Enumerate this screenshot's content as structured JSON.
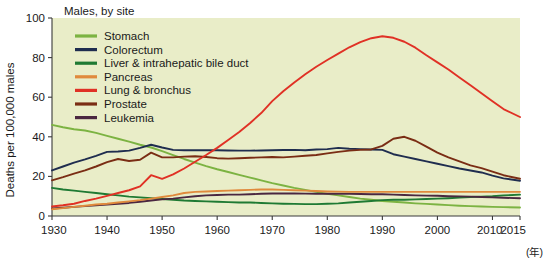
{
  "chart_data": {
    "type": "line",
    "title": "Males, by site",
    "xlabel": "",
    "ylabel": "Deaths per 100,000 males",
    "unit_note": "(年)",
    "xlim": [
      1930,
      2015
    ],
    "ylim": [
      0,
      100
    ],
    "xticks": [
      1930,
      1940,
      1950,
      1960,
      1970,
      1980,
      1990,
      2000,
      2010,
      2015
    ],
    "xtick_labels": [
      "1930",
      "1940",
      "1950",
      "1960",
      "1970",
      "1980",
      "1990",
      "2000",
      "2010",
      "2015"
    ],
    "yticks": [
      0,
      20,
      40,
      60,
      80,
      100
    ],
    "ytick_labels": [
      "0",
      "20",
      "40",
      "60",
      "80",
      "100"
    ],
    "grid": false,
    "legend_position": "upper-left-inside",
    "plot_background": "#e9edc8",
    "x": [
      1930,
      1932,
      1934,
      1936,
      1938,
      1940,
      1942,
      1944,
      1946,
      1948,
      1950,
      1952,
      1954,
      1956,
      1958,
      1960,
      1962,
      1964,
      1966,
      1968,
      1970,
      1972,
      1974,
      1976,
      1978,
      1980,
      1982,
      1984,
      1986,
      1988,
      1990,
      1992,
      1994,
      1996,
      1998,
      2000,
      2002,
      2004,
      2006,
      2008,
      2010,
      2012,
      2015
    ],
    "series": [
      {
        "name": "Stomach",
        "color": "#7cb342",
        "values": [
          46.0,
          44.8,
          43.8,
          43.2,
          42.0,
          40.5,
          39.0,
          37.6,
          36.0,
          34.6,
          32.8,
          30.8,
          28.8,
          27.0,
          25.2,
          23.6,
          22.2,
          20.8,
          19.4,
          18.0,
          16.6,
          15.4,
          14.2,
          13.2,
          12.2,
          11.2,
          10.4,
          9.6,
          8.8,
          8.2,
          7.6,
          7.2,
          6.8,
          6.4,
          6.1,
          5.8,
          5.5,
          5.2,
          5.0,
          4.8,
          4.6,
          4.5,
          4.3
        ]
      },
      {
        "name": "Colorectum",
        "color": "#1f2d4f",
        "values": [
          23.0,
          25.0,
          27.0,
          28.6,
          30.4,
          32.4,
          32.6,
          33.0,
          34.4,
          36.0,
          34.6,
          33.4,
          33.2,
          33.2,
          33.2,
          33.2,
          33.1,
          33.0,
          33.0,
          33.1,
          33.2,
          33.3,
          33.4,
          33.2,
          33.6,
          33.8,
          34.4,
          34.0,
          33.8,
          33.6,
          33.4,
          31.2,
          30.0,
          28.8,
          27.6,
          26.4,
          25.2,
          24.0,
          23.0,
          22.0,
          20.4,
          19.0,
          17.8
        ]
      },
      {
        "name": "Liver & intrahepatic bile duct",
        "color": "#1f7a33",
        "values": [
          14.2,
          13.4,
          12.8,
          12.2,
          11.6,
          11.0,
          10.4,
          9.8,
          9.4,
          9.0,
          8.6,
          8.2,
          7.8,
          7.6,
          7.4,
          7.2,
          7.0,
          6.8,
          6.8,
          6.6,
          6.4,
          6.2,
          6.1,
          6.0,
          6.0,
          6.2,
          6.4,
          6.8,
          7.2,
          7.6,
          8.0,
          8.2,
          8.2,
          8.4,
          8.6,
          8.8,
          9.0,
          9.3,
          9.6,
          9.8,
          10.0,
          10.4,
          10.8
        ]
      },
      {
        "name": "Pancreas",
        "color": "#e08a3c",
        "values": [
          3.4,
          4.0,
          4.6,
          5.2,
          5.8,
          6.2,
          6.8,
          7.4,
          8.0,
          8.8,
          9.6,
          10.4,
          11.6,
          12.2,
          12.4,
          12.6,
          12.8,
          13.0,
          13.2,
          13.4,
          13.4,
          13.2,
          13.0,
          12.8,
          12.6,
          12.4,
          12.3,
          12.2,
          12.2,
          12.2,
          12.2,
          12.2,
          12.2,
          12.2,
          12.2,
          12.2,
          12.2,
          12.2,
          12.2,
          12.2,
          12.2,
          12.2,
          12.2
        ]
      },
      {
        "name": "Lung & bronchus",
        "color": "#e03125",
        "values": [
          4.8,
          5.4,
          6.2,
          7.6,
          8.8,
          10.2,
          11.6,
          13.0,
          15.0,
          20.6,
          18.8,
          21.0,
          24.0,
          27.4,
          30.8,
          34.4,
          38.4,
          42.4,
          47.0,
          52.0,
          58.0,
          63.0,
          67.4,
          71.6,
          75.4,
          78.8,
          82.0,
          85.2,
          87.8,
          89.8,
          90.8,
          90.0,
          88.0,
          85.0,
          81.2,
          77.6,
          74.0,
          70.0,
          66.0,
          62.0,
          58.0,
          54.0,
          50.0
        ]
      },
      {
        "name": "Prostate",
        "color": "#7a2d14",
        "values": [
          18.0,
          19.6,
          21.4,
          23.0,
          25.0,
          27.2,
          28.8,
          27.8,
          28.4,
          32.0,
          29.6,
          29.6,
          30.0,
          30.2,
          29.8,
          29.2,
          29.0,
          29.2,
          29.4,
          29.6,
          29.8,
          29.6,
          30.0,
          30.4,
          30.8,
          31.6,
          32.4,
          33.0,
          33.4,
          33.6,
          35.4,
          39.0,
          40.0,
          38.0,
          35.0,
          32.0,
          29.6,
          27.6,
          25.6,
          24.2,
          22.4,
          20.6,
          18.8
        ]
      },
      {
        "name": "Leukemia",
        "color": "#4a2740",
        "values": [
          3.8,
          4.2,
          4.6,
          5.0,
          5.4,
          5.8,
          6.2,
          6.6,
          7.2,
          7.8,
          8.4,
          8.8,
          9.4,
          10.0,
          10.4,
          10.6,
          10.8,
          10.8,
          11.0,
          11.2,
          11.4,
          11.4,
          11.4,
          11.3,
          11.2,
          11.2,
          11.2,
          11.2,
          11.1,
          11.0,
          11.0,
          10.8,
          10.6,
          10.4,
          10.3,
          10.2,
          10.0,
          9.9,
          9.8,
          9.6,
          9.4,
          9.2,
          9.0
        ]
      }
    ]
  }
}
